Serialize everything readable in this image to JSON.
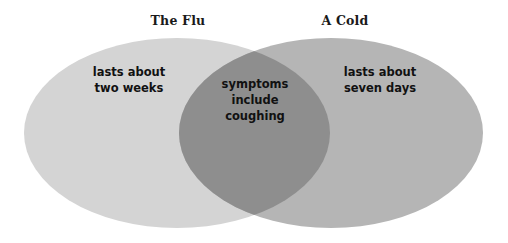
{
  "diagram": {
    "type": "venn",
    "title_left": "The Flu",
    "title_right": "A Cold",
    "background_color": "#ffffff",
    "left_set": {
      "label": "The Flu",
      "fill_color": "#d4d4d4",
      "text_lines": [
        "lasts about",
        "two weeks"
      ]
    },
    "right_set": {
      "label": "A Cold",
      "fill_color": "#b5b5b5",
      "text_lines": [
        "lasts about",
        "seven days"
      ]
    },
    "intersection": {
      "fill_color": "#8e8e8e",
      "text_lines": [
        "symptoms",
        "include",
        "coughing"
      ]
    }
  }
}
